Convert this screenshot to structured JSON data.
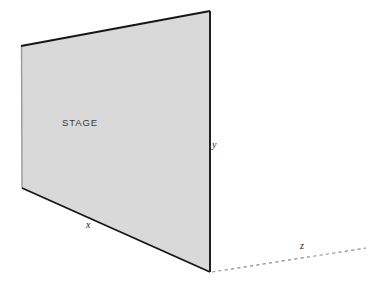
{
  "diagram": {
    "stage": {
      "label": "STAGE",
      "fill_color": "#d9d9d9",
      "edge_color_dark": "#1a1a1a",
      "edge_color_light": "#9a9a9a",
      "corners": {
        "top_left": [
          21,
          46
        ],
        "top_right": [
          210,
          11
        ],
        "bottom_right": [
          210,
          272
        ],
        "bottom_left": [
          22,
          188
        ]
      }
    },
    "axes": [
      {
        "name": "x",
        "label": "x",
        "style": "solid",
        "from": [
          22,
          188
        ],
        "to": [
          210,
          272
        ],
        "label_pos": [
          86,
          220
        ]
      },
      {
        "name": "y",
        "label": "y",
        "style": "solid",
        "from": [
          210,
          11
        ],
        "to": [
          210,
          272
        ],
        "label_pos": [
          212,
          140
        ]
      },
      {
        "name": "z",
        "label": "z",
        "style": "dashed",
        "from": [
          212,
          272
        ],
        "to": [
          366,
          248
        ],
        "label_pos": [
          300,
          241
        ],
        "color": "#8d8d8d"
      }
    ]
  },
  "background_color": "#ffffff"
}
